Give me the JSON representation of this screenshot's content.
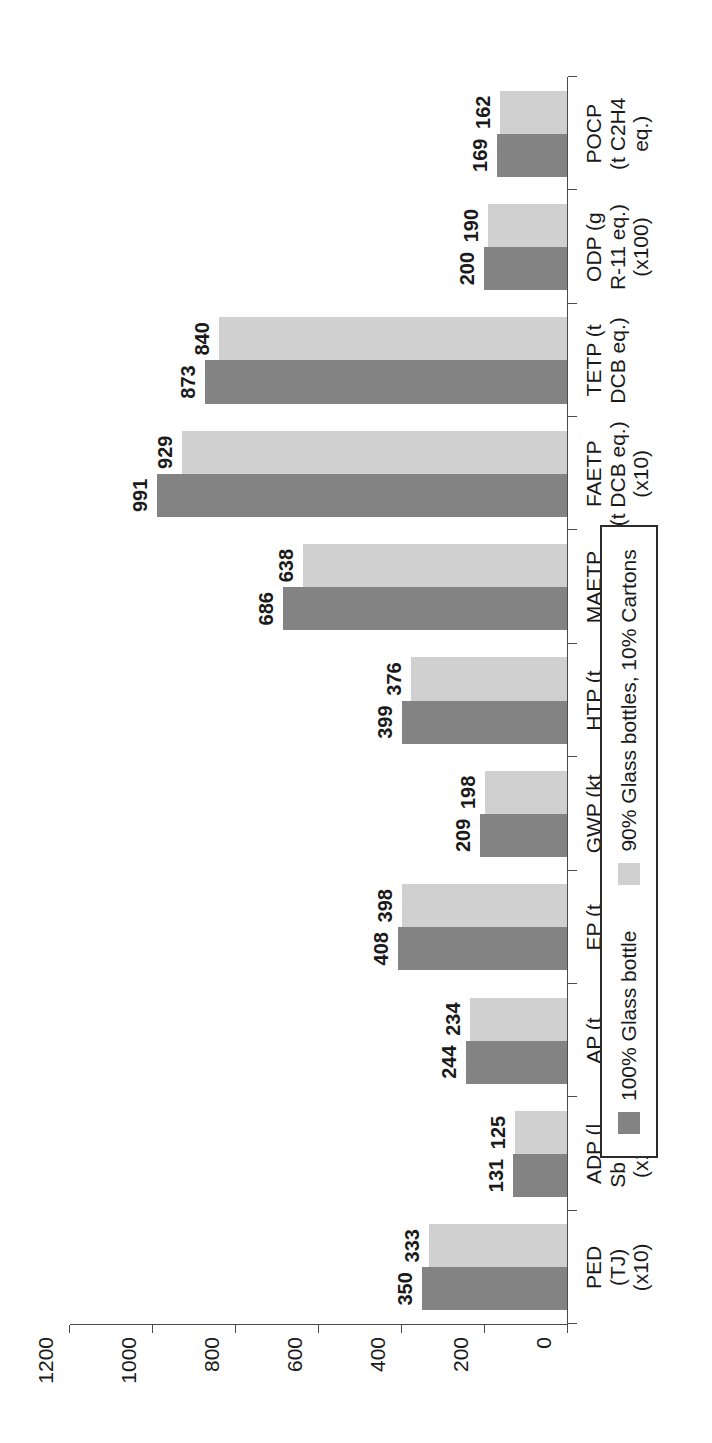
{
  "chart_data": {
    "type": "bar",
    "title": "",
    "xlabel": "",
    "ylabel": "",
    "ylim": [
      0,
      1200
    ],
    "yticks": [
      0,
      200,
      400,
      600,
      800,
      1000,
      1200
    ],
    "grid": false,
    "legend_position": "left-outside",
    "orientation": "horizontal-rotated",
    "categories": [
      "PED\n(TJ)\n(x10)",
      "ADP (l\nSb eq.)\n(x10)",
      "AP (t\nSO2 eq.)\n(x10)",
      "EP (t\nPO4 eq.)",
      "GWP (kt\nCO2 eq.)",
      "HTP (t\nDCB eq.)\n(x100)",
      "MAETP\n(t DCB eq.)\n(x10^5)",
      "FAETP\n(t DCB eq.)\n(x10)",
      "TETP (t\nDCB eq.)",
      "ODP (g\nR-11 eq.)\n(x100)",
      "POCP\n(t C2H4\neq.)"
    ],
    "series": [
      {
        "name": "100% Glass bottle",
        "color": "#838383",
        "values": [
          350,
          131,
          244,
          408,
          209,
          399,
          686,
          991,
          873,
          200,
          169
        ]
      },
      {
        "name": "90% Glass bottles, 10% Cartons",
        "color": "#d0d0d0",
        "values": [
          333,
          125,
          234,
          398,
          198,
          376,
          638,
          929,
          840,
          190,
          162
        ]
      }
    ]
  },
  "legend": {
    "items": [
      {
        "label": "100% Glass bottle",
        "swatch": "dark"
      },
      {
        "label": "90% Glass bottles, 10% Cartons",
        "swatch": "light"
      }
    ]
  },
  "colors": {
    "series_dark": "#838383",
    "series_light": "#d0d0d0",
    "axis": "#4a4a4a",
    "text": "#1a1a1a",
    "background": "#ffffff"
  }
}
